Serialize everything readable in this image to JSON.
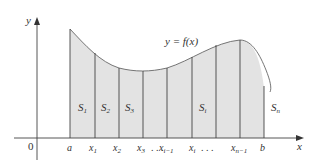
{
  "diagram": {
    "curve_label": "y = f(x)",
    "axes": {
      "x_label": "x",
      "y_label": "y",
      "origin_label": "0"
    },
    "tick_labels": [
      "a",
      "x1",
      "x2",
      "x3",
      "...",
      "xi-1",
      "xi",
      "...",
      "xn-1",
      "b"
    ],
    "strip_labels": [
      "S1",
      "S2",
      "S3",
      "Si",
      "Sn"
    ],
    "colors": {
      "fill": "#e3e3e3",
      "stroke": "#555555",
      "axis": "#444444"
    }
  }
}
